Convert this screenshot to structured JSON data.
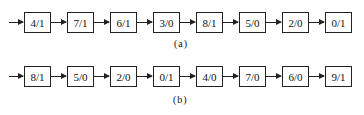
{
  "diagram_a": {
    "caption": "(a)",
    "nodes": [
      "4/1",
      "7/1",
      "6/1",
      "3/0",
      "8/1",
      "5/0",
      "2/0",
      "0/1"
    ]
  },
  "diagram_b": {
    "caption": "(b)",
    "nodes": [
      "8/1",
      "5/0",
      "2/0",
      "0/1",
      "4/0",
      "7/0",
      "6/0",
      "9/1"
    ]
  }
}
